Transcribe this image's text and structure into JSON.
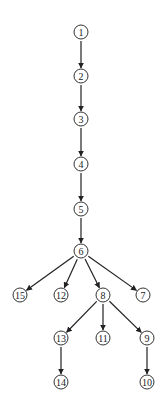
{
  "diagram": {
    "type": "tree",
    "direction": "top-down",
    "node_radius": 7,
    "colors": {
      "stroke": "#333333",
      "background": "#ffffff",
      "text": "#222222"
    },
    "nodes": [
      {
        "id": "1",
        "label": "1",
        "x": 81,
        "y": 32
      },
      {
        "id": "2",
        "label": "2",
        "x": 81,
        "y": 76
      },
      {
        "id": "3",
        "label": "3",
        "x": 81,
        "y": 119
      },
      {
        "id": "4",
        "label": "4",
        "x": 81,
        "y": 164
      },
      {
        "id": "5",
        "label": "5",
        "x": 81,
        "y": 209
      },
      {
        "id": "6",
        "label": "6",
        "x": 81,
        "y": 251
      },
      {
        "id": "15",
        "label": "15",
        "x": 20,
        "y": 295
      },
      {
        "id": "12",
        "label": "12",
        "x": 61,
        "y": 295
      },
      {
        "id": "8",
        "label": "8",
        "x": 103,
        "y": 295
      },
      {
        "id": "7",
        "label": "7",
        "x": 143,
        "y": 295
      },
      {
        "id": "13",
        "label": "13",
        "x": 61,
        "y": 338
      },
      {
        "id": "11",
        "label": "11",
        "x": 103,
        "y": 338
      },
      {
        "id": "9",
        "label": "9",
        "x": 147,
        "y": 338
      },
      {
        "id": "14",
        "label": "14",
        "x": 61,
        "y": 382
      },
      {
        "id": "10",
        "label": "10",
        "x": 147,
        "y": 382
      }
    ],
    "edges": [
      {
        "from": "1",
        "to": "2"
      },
      {
        "from": "2",
        "to": "3"
      },
      {
        "from": "3",
        "to": "4"
      },
      {
        "from": "4",
        "to": "5"
      },
      {
        "from": "5",
        "to": "6"
      },
      {
        "from": "6",
        "to": "15"
      },
      {
        "from": "6",
        "to": "12"
      },
      {
        "from": "6",
        "to": "8"
      },
      {
        "from": "6",
        "to": "7"
      },
      {
        "from": "8",
        "to": "13"
      },
      {
        "from": "8",
        "to": "11"
      },
      {
        "from": "8",
        "to": "9"
      },
      {
        "from": "13",
        "to": "14"
      },
      {
        "from": "9",
        "to": "10"
      }
    ]
  }
}
